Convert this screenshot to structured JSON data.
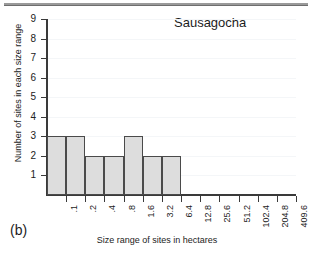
{
  "figure": {
    "panel_label": "(b)",
    "title": "Sausagocha"
  },
  "chart_data": {
    "type": "bar",
    "title": "Sausagocha",
    "xlabel": "Size range of sites in hectares",
    "ylabel": "Number of sites in each size range",
    "categories": [
      ".1",
      ".2",
      ".4",
      ".8",
      "1.6",
      "3.2",
      "6.4",
      "12.8",
      "25.6",
      "51.2",
      "102.4",
      "204.8",
      "409.6"
    ],
    "values": [
      3,
      3,
      2,
      2,
      3,
      2,
      2,
      0,
      0,
      0,
      0,
      0,
      0
    ],
    "ylim": [
      0,
      9
    ],
    "yticks": [
      1,
      2,
      3,
      4,
      5,
      6,
      7,
      8,
      9
    ],
    "ytick_labels": [
      "1",
      "2",
      "3",
      "4",
      "5",
      "6",
      "7",
      "8",
      "9"
    ],
    "grid": true,
    "legend": false,
    "bar_fill_color": "#dddddd",
    "bar_edge_color": "#4a4a4a",
    "axis_color": "#3a3a3a"
  }
}
